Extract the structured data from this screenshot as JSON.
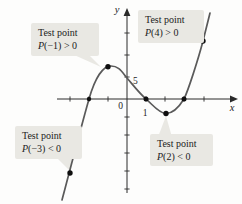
{
  "figure": {
    "background": "#fdfdfc",
    "axis_color": "#2a2a2a",
    "curve_color": "#5a5a5a",
    "point_color": "#0f0f0f",
    "callout_bg": "#e9e8e3",
    "axes": {
      "x_axis": {
        "x1": 57,
        "y1": 99,
        "x2": 232,
        "y2": 99
      },
      "x_arrow": "238,99 230,95.6 230,102.4",
      "y_axis": {
        "x1": 127,
        "y1": 193,
        "x2": 127,
        "y2": 15
      },
      "y_arrow": "127,8 123.6,16 130.4,16"
    },
    "x_ticks": [
      70,
      89,
      108,
      146,
      165,
      184,
      204
    ],
    "y_ticks": [
      33,
      55,
      77,
      117,
      135,
      153,
      171,
      189
    ],
    "tick_half": 2.6,
    "axis_annotations": [
      {
        "text": "0",
        "x": 123,
        "y": 109,
        "anchor": "end",
        "italic": false,
        "size": 9.5,
        "name": "origin-label"
      },
      {
        "text": "5",
        "x": 133,
        "y": 84,
        "anchor": "start",
        "italic": false,
        "size": 9.5,
        "name": "y-tick-label-5"
      },
      {
        "text": "1",
        "x": 145,
        "y": 116,
        "anchor": "middle",
        "italic": false,
        "size": 9.5,
        "name": "x-tick-label-1"
      },
      {
        "text": "x",
        "x": 232,
        "y": 111,
        "anchor": "middle",
        "italic": true,
        "size": 10.5,
        "name": "x-axis-label"
      },
      {
        "text": "y",
        "x": 117,
        "y": 13,
        "anchor": "middle",
        "italic": true,
        "size": 10.5,
        "name": "y-axis-label"
      }
    ],
    "curve_path": "M62,200 C68,178 78,138 89,99 C95,78 103,66 111,66 C119,66 122,72 127,78 C133,85 140,94 146,99 C152,104 159,113.5 166,113.5 C173,113.5 179,107 184,99 C188,91 198,60 203,41 C205,33 208,21 210,13",
    "points": [
      {
        "x": 70,
        "y": 173,
        "r": 2.7,
        "name": "point-test-p-neg3"
      },
      {
        "x": 89,
        "y": 99,
        "r": 2.2,
        "name": "point-zero-neg2"
      },
      {
        "x": 108,
        "y": 66.8,
        "r": 2.7,
        "name": "point-test-p-neg1"
      },
      {
        "x": 146,
        "y": 99,
        "r": 2.5,
        "name": "point-zero-1"
      },
      {
        "x": 166,
        "y": 113.5,
        "r": 2.7,
        "name": "point-test-p-2"
      },
      {
        "x": 184,
        "y": 99,
        "r": 2.5,
        "name": "point-zero-3"
      },
      {
        "x": 203,
        "y": 41,
        "r": 2.7,
        "name": "point-test-p-4"
      }
    ],
    "tails": [
      {
        "points": "72,54 88,54 101,67",
        "name": "callout-tail-p-neg1"
      },
      {
        "points": "56,157 72,157 70,171",
        "name": "callout-tail-p-neg3"
      },
      {
        "points": "158,137 172,137 166,116",
        "name": "callout-tail-p-2"
      }
    ]
  },
  "callouts": [
    {
      "line1": "Test point",
      "var": "P",
      "rest": "(−1) > 0"
    },
    {
      "line1": "Test point",
      "var": "P",
      "rest": "(4) > 0"
    },
    {
      "line1": "Test point",
      "var": "P",
      "rest": "(−3) < 0"
    },
    {
      "line1": "Test point",
      "var": "P",
      "rest": "(2) < 0"
    }
  ]
}
